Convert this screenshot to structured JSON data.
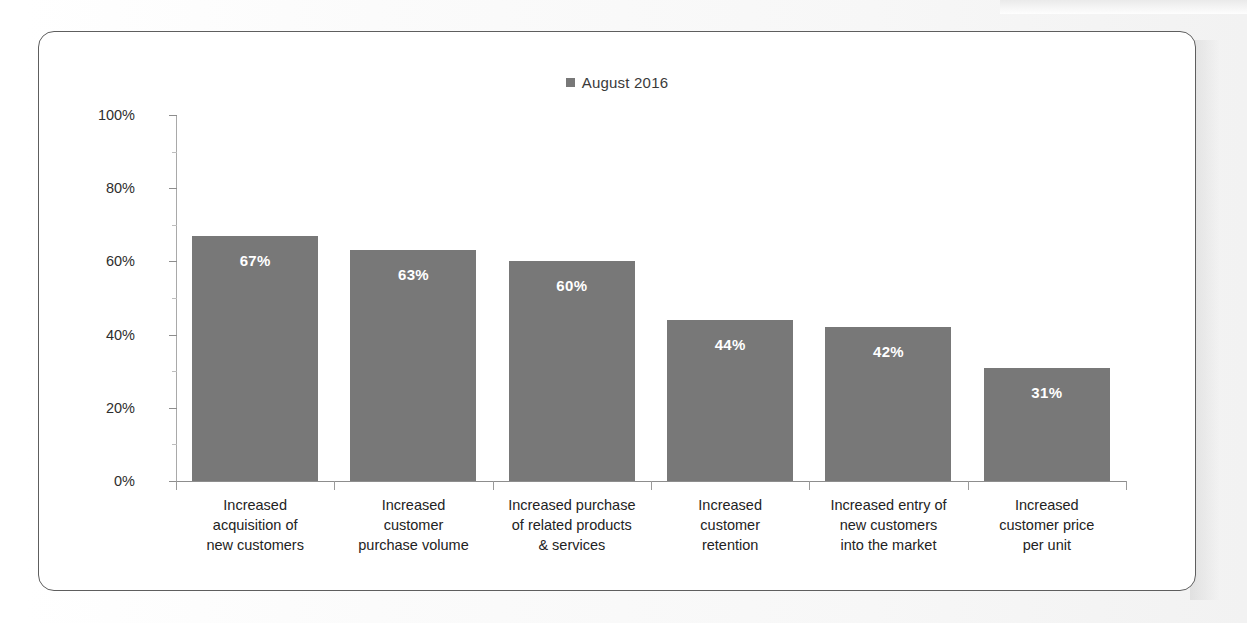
{
  "legend": {
    "marker": "filled-square",
    "label": "August 2016",
    "color": "#787878"
  },
  "axis": {
    "y_ticks": [
      "0%",
      "20%",
      "40%",
      "60%",
      "80%",
      "100%"
    ]
  },
  "categories": [
    {
      "lines": [
        "Increased",
        "acquisition of",
        "new customers"
      ],
      "value_label": "67%"
    },
    {
      "lines": [
        "Increased",
        "customer",
        "purchase volume"
      ],
      "value_label": "63%"
    },
    {
      "lines": [
        "Increased purchase",
        "of related products",
        "& services"
      ],
      "value_label": "60%"
    },
    {
      "lines": [
        "Increased",
        "customer",
        "retention"
      ],
      "value_label": "44%"
    },
    {
      "lines": [
        "Increased entry of",
        "new customers",
        "into the market"
      ],
      "value_label": "42%"
    },
    {
      "lines": [
        "Increased",
        "customer price",
        "per unit"
      ],
      "value_label": "31%"
    }
  ],
  "chart_data": {
    "type": "bar",
    "title": "",
    "subtitle": "",
    "xlabel": "",
    "ylabel": "",
    "categories": [
      "Increased acquisition of new customers",
      "Increased customer purchase volume",
      "Increased purchase of related products & services",
      "Increased customer retention",
      "Increased entry of new customers into the market",
      "Increased customer price per unit"
    ],
    "series": [
      {
        "name": "August 2016",
        "values": [
          67,
          63,
          60,
          44,
          42,
          31
        ],
        "value_labels": [
          "67%",
          "63%",
          "60%",
          "44%",
          "42%",
          "31%"
        ],
        "color": "#787878"
      }
    ],
    "ylim": [
      0,
      100
    ],
    "y_ticks": [
      0,
      20,
      40,
      60,
      80,
      100
    ],
    "y_tick_labels": [
      "0%",
      "20%",
      "40%",
      "60%",
      "80%",
      "100%"
    ],
    "units": "percent",
    "grid": false,
    "legend_position": "top-center",
    "data_label_position": "inside-top",
    "data_label_color": "#ffffff"
  }
}
